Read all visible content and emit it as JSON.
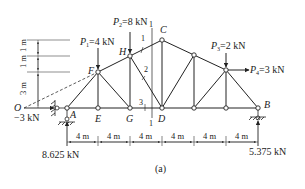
{
  "figure": {
    "caption": "(a)"
  },
  "nodes": {
    "O": "O",
    "A": "A",
    "E": "E",
    "G": "G",
    "D": "D",
    "B": "B",
    "F": "F",
    "H": "H",
    "C": "C"
  },
  "loads": {
    "P1": {
      "name": "P",
      "sub": "1",
      "value": "=4 kN"
    },
    "P2": {
      "name": "P",
      "sub": "2",
      "value": "=8 kN"
    },
    "P3": {
      "name": "P",
      "sub": "3",
      "value": "=2 kN"
    },
    "P4": {
      "name": "P",
      "sub": "4",
      "value": "=3 kN"
    }
  },
  "reactions": {
    "A_horizontal": "−3 kN",
    "A_vertical": "8.625 kN",
    "B_vertical": "5.375 kN"
  },
  "section_labels": {
    "cut_top": "1",
    "cut_bottom": "1",
    "member1": "1",
    "member2": "2",
    "member3": "3"
  },
  "dimensions": {
    "horizontal": [
      "4 m",
      "4 m",
      "4 m",
      "4 m",
      "4 m",
      "4 m"
    ],
    "vertical": [
      "3 m",
      "1 m",
      "1 m"
    ]
  }
}
